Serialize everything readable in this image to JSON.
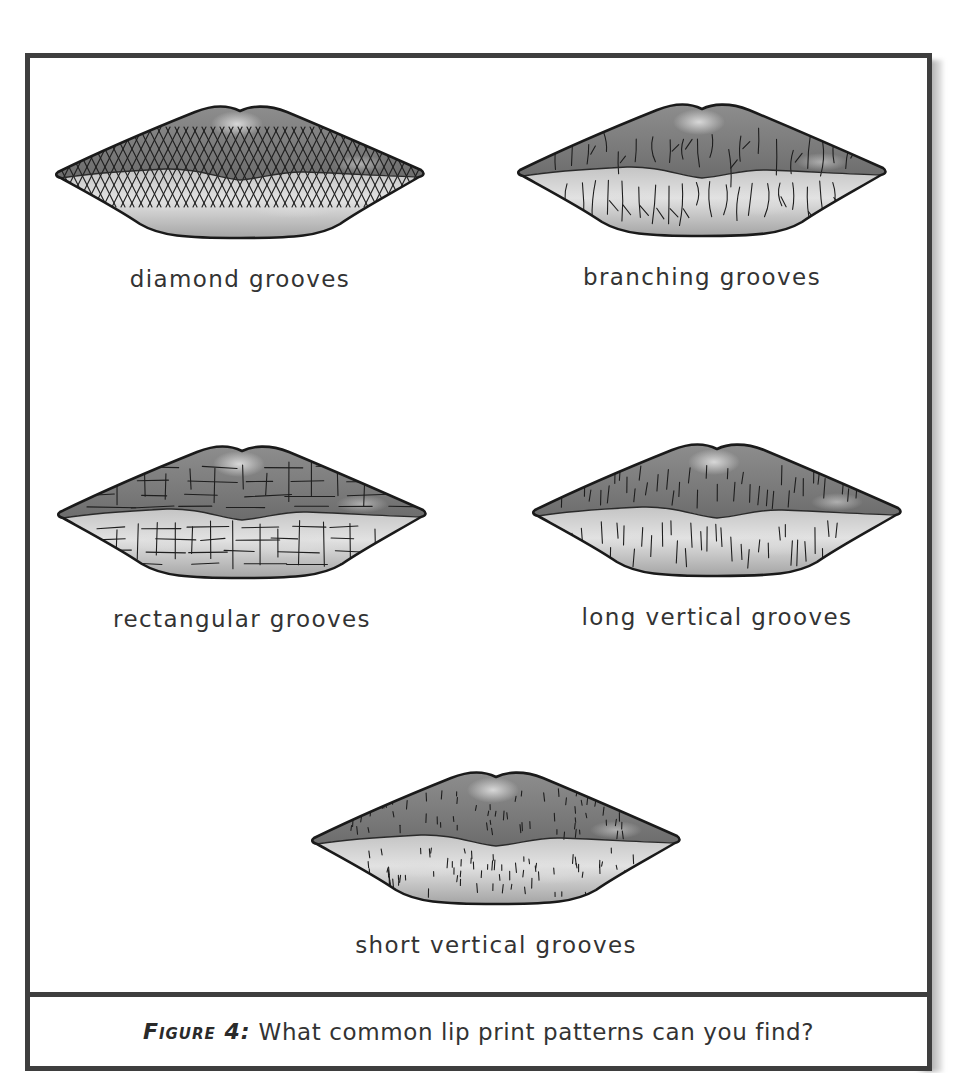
{
  "figure": {
    "tag": "Figure 4:",
    "caption": "What common lip print patterns can you find?"
  },
  "patterns": [
    {
      "label": "diamond grooves",
      "pattern": "diamond",
      "icon": "lips-diamond-grooves-icon"
    },
    {
      "label": "branching grooves",
      "pattern": "branching",
      "icon": "lips-branching-grooves-icon"
    },
    {
      "label": "rectangular grooves",
      "pattern": "rectangular",
      "icon": "lips-rectangular-grooves-icon"
    },
    {
      "label": "long vertical grooves",
      "pattern": "long-vertical",
      "icon": "lips-long-vertical-grooves-icon"
    },
    {
      "label": "short vertical grooves",
      "pattern": "short-vertical",
      "icon": "lips-short-vertical-grooves-icon"
    }
  ],
  "colors": {
    "frame": "#3e3e3e",
    "text": "#333333",
    "upper_lip": "#7a7a7a",
    "lower_lip": "#b4b4b4",
    "highlight": "#e2e2e2",
    "outline": "#1a1a1a"
  }
}
